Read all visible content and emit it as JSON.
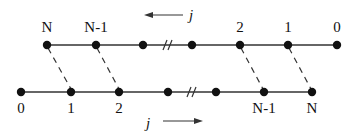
{
  "diagram": {
    "colors": {
      "ink": "#111111",
      "line": "#333333",
      "background": "#ffffff"
    },
    "top_chain": {
      "direction_label": "j",
      "direction": "right-to-left",
      "labels": [
        "N",
        "N-1",
        "2",
        "1",
        "0"
      ],
      "break_symbol": "//"
    },
    "bottom_chain": {
      "direction_label": "j",
      "direction": "left-to-right",
      "labels": [
        "0",
        "1",
        "2",
        "N-1",
        "N"
      ],
      "break_symbol": "//"
    },
    "connections": "dashed links pair top node k with bottom node k for k = N, N-1, 2, 1"
  }
}
